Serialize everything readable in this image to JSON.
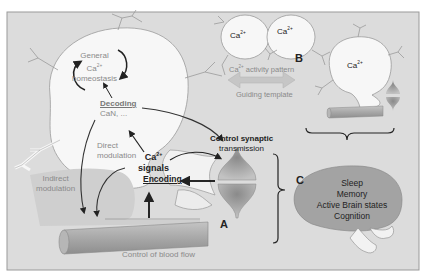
{
  "figure": {
    "colors": {
      "background": "#dcdcdc",
      "frame": "#9a9a9a",
      "cell_fill": "#f7f7f7",
      "vessel": "#a9a9a9",
      "synapse": "#9c9c9c",
      "brain": "#a3a3a3",
      "arrow_dark": "#222222",
      "arrow_gray": "#bdbdbd"
    },
    "panel_labels": {
      "a": "A",
      "b": "B",
      "c": "C"
    },
    "panel_a": {
      "homeostasis_line1": "General",
      "homeostasis_line2": "Ca",
      "homeostasis_sup": "2+",
      "homeostasis_line3": "homeostasis",
      "decoding_title": "Decoding",
      "decoding_sub": "CaN, ...",
      "direct_modulation_line1": "Direct",
      "direct_modulation_line2": "modulation",
      "indirect_modulation_line1": "Indirect",
      "indirect_modulation_line2": "modulation",
      "ca_signals_line1": "Ca",
      "ca_signals_sup": "2+",
      "ca_signals_line2": "signals",
      "encoding": "Encoding",
      "control_synaptic_line1": "Control synaptic",
      "control_synaptic_line2": "transmission",
      "control_blood_flow": "Control of blood flow"
    },
    "panel_b": {
      "cell1_label": "Ca",
      "cell2_label": "Ca",
      "cell3_label": "Ca",
      "sup": "2+",
      "activity_pattern_prefix": "Ca",
      "activity_pattern_suffix": " activity pattern",
      "guiding_template": "Guiding template"
    },
    "panel_c": {
      "brain_functions": [
        "Sleep",
        "Memory",
        "Active Brain states",
        "Cognition"
      ]
    }
  }
}
